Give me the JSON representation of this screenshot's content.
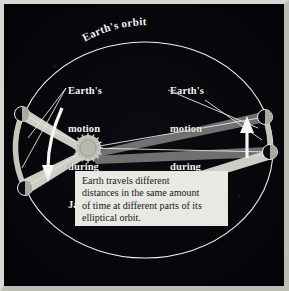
{
  "figure": {
    "title": "Earth's orbit",
    "kind": "astronomy-diagram",
    "background_color": "#05050a",
    "frame_color": "#d8d8d2"
  },
  "orbit": {
    "label": "Earth's orbit",
    "stroke_color": "#f0f0ea"
  },
  "sun": {
    "name": "Sun",
    "fill_color": "#c9c9c2"
  },
  "labels": {
    "january": {
      "line1": "Earth's",
      "line2": "motion",
      "line3": "during",
      "line4": "January"
    },
    "july": {
      "line1": "Earth's",
      "line2": "motion",
      "line3": "during",
      "line4": "July"
    }
  },
  "caption": {
    "line1": "Earth travels different",
    "line2": "distances in the same amount",
    "line3": "of time at different parts of its",
    "line4": "elliptical orbit.",
    "background_color": "#e9e9e4",
    "text_color": "#16161a"
  },
  "earth_positions": [
    {
      "id": "january-start",
      "side": "left",
      "x": 22,
      "y": 114
    },
    {
      "id": "january-end",
      "side": "left",
      "x": 25,
      "y": 188
    },
    {
      "id": "july-end",
      "side": "right",
      "x": 265,
      "y": 117
    },
    {
      "id": "july-start",
      "side": "right",
      "x": 270,
      "y": 152
    }
  ],
  "motion_arcs": [
    {
      "id": "january-arc",
      "direction": "downward",
      "arrow_color": "#f2f2ee"
    },
    {
      "id": "july-arc",
      "direction": "upward",
      "arrow_color": "#f2f2ee"
    }
  ],
  "sweep_sectors": [
    {
      "id": "january-sector",
      "color": "#d6d6cf"
    },
    {
      "id": "july-sector",
      "color": "#d6d6cf"
    }
  ]
}
